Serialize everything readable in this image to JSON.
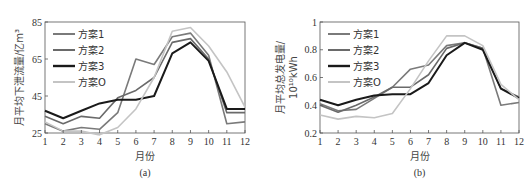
{
  "chart_data": [
    {
      "type": "line",
      "caption": "(a)",
      "title": "",
      "xlabel": "月份",
      "ylabel": "月平均下泄流量/亿m³",
      "x": [
        1,
        2,
        3,
        4,
        5,
        6,
        7,
        8,
        9,
        10,
        11,
        12
      ],
      "xlim": [
        1,
        12
      ],
      "ylim": [
        25,
        85
      ],
      "yticks": [
        25,
        45,
        65,
        85
      ],
      "grid": false,
      "legend_position": "upper left",
      "series": [
        {
          "name": "方案1",
          "color": "#7a7a7a",
          "width": 1.6,
          "values": [
            30,
            26,
            28,
            27,
            36,
            65,
            62,
            77,
            79,
            67,
            30,
            31
          ]
        },
        {
          "name": "方案2",
          "color": "#6a6a6a",
          "width": 1.6,
          "values": [
            34,
            30,
            34,
            33,
            44,
            48,
            55,
            74,
            76,
            65,
            36,
            36
          ]
        },
        {
          "name": "方案3",
          "color": "#1a1a1a",
          "width": 2.0,
          "values": [
            37,
            33,
            37,
            41,
            43,
            43,
            45,
            68,
            74,
            64,
            38,
            38
          ]
        },
        {
          "name": "方案O",
          "color": "#c4c4c4",
          "width": 1.6,
          "values": [
            31,
            26,
            26,
            24,
            28,
            38,
            55,
            80,
            82,
            72,
            58,
            39
          ]
        }
      ]
    },
    {
      "type": "line",
      "caption": "(b)",
      "title": "",
      "xlabel": "月份",
      "ylabel": "月平均总发电量/10¹⁰kWh",
      "ylabel_line1": "月平均总发电量/",
      "ylabel_line2": "10¹⁰kWh",
      "x": [
        1,
        2,
        3,
        4,
        5,
        6,
        7,
        8,
        9,
        10,
        11,
        12
      ],
      "xlim": [
        1,
        12
      ],
      "ylim": [
        0.2,
        1.0
      ],
      "yticks": [
        0.2,
        0.4,
        0.6,
        0.8,
        1.0
      ],
      "ytick_labels": [
        "0.2",
        "0.4",
        "0.6",
        "0.8",
        "1"
      ],
      "grid": false,
      "legend_position": "upper left",
      "series": [
        {
          "name": "方案1",
          "color": "#7a7a7a",
          "width": 1.6,
          "values": [
            0.41,
            0.36,
            0.37,
            0.45,
            0.53,
            0.66,
            0.69,
            0.83,
            0.85,
            0.81,
            0.4,
            0.42
          ]
        },
        {
          "name": "方案2",
          "color": "#6a6a6a",
          "width": 1.6,
          "values": [
            0.4,
            0.35,
            0.4,
            0.46,
            0.53,
            0.53,
            0.62,
            0.81,
            0.85,
            0.81,
            0.52,
            0.46
          ]
        },
        {
          "name": "方案3",
          "color": "#1a1a1a",
          "width": 2.0,
          "values": [
            0.44,
            0.4,
            0.44,
            0.47,
            0.48,
            0.48,
            0.56,
            0.76,
            0.85,
            0.8,
            0.52,
            0.45
          ]
        },
        {
          "name": "方案O",
          "color": "#c4c4c4",
          "width": 1.6,
          "values": [
            0.33,
            0.3,
            0.32,
            0.31,
            0.34,
            0.52,
            0.72,
            0.9,
            0.9,
            0.83,
            0.55,
            0.44
          ]
        }
      ]
    }
  ]
}
